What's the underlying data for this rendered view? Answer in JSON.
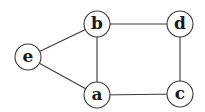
{
  "graph": {
    "title": "",
    "node_radius": 13,
    "nodes": [
      {
        "id": "e",
        "label": "e",
        "x": 28,
        "y": 57
      },
      {
        "id": "b",
        "label": "b",
        "x": 97,
        "y": 24
      },
      {
        "id": "d",
        "label": "d",
        "x": 180,
        "y": 24
      },
      {
        "id": "a",
        "label": "a",
        "x": 97,
        "y": 95
      },
      {
        "id": "c",
        "label": "c",
        "x": 180,
        "y": 94
      }
    ],
    "edges": [
      {
        "from": "e",
        "to": "b"
      },
      {
        "from": "e",
        "to": "a"
      },
      {
        "from": "b",
        "to": "d"
      },
      {
        "from": "b",
        "to": "a"
      },
      {
        "from": "d",
        "to": "c"
      },
      {
        "from": "a",
        "to": "c"
      }
    ],
    "colors": {
      "stroke": "#3a3a3a",
      "fill": "#ffffff",
      "label": "#1a1a1a"
    }
  }
}
